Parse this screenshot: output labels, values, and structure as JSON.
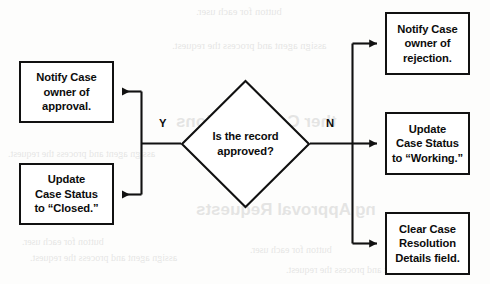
{
  "figure": {
    "width": 490,
    "height": 284,
    "line_color": "#111111",
    "background_color": "#fdfdfc",
    "text_color": "#0c0c0c"
  },
  "decision": {
    "line1": "Is the record",
    "line2": "approved?",
    "text": "Is the record approved?"
  },
  "branches": {
    "yes_label": "Y",
    "no_label": "N"
  },
  "yes_nodes": [
    {
      "id": "notify-approval",
      "line1": "Notify Case",
      "line2": "owner of",
      "line3": "approval.",
      "text": "Notify Case owner of approval."
    },
    {
      "id": "status-closed",
      "line1": "Update",
      "line2": "Case Status",
      "line3": "to “Closed.”",
      "text": "Update Case Status to “Closed.”"
    }
  ],
  "no_nodes": [
    {
      "id": "notify-rejection",
      "line1": "Notify Case",
      "line2": "owner of",
      "line3": "rejection.",
      "text": "Notify Case owner of rejection."
    },
    {
      "id": "status-working",
      "line1": "Update",
      "line2": "Case Status",
      "line3": "to “Working.”",
      "text": "Update Case Status to “Working.”"
    },
    {
      "id": "clear-resolution",
      "line1": "Clear Case",
      "line2": "Resolution",
      "line3": "Details field.",
      "text": "Clear Case Resolution Details field."
    }
  ],
  "bleed_through": {
    "note": "Faint mirrored show-through text from the reverse side of the printed page",
    "lines": [
      "button for each user.",
      "assign agent and process the request.",
      "ther Considerations",
      "ng Approval Requests"
    ]
  }
}
